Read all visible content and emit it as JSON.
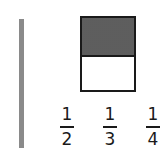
{
  "figure": {
    "vertical_bar": {
      "style": "stippled-gray"
    },
    "fraction_box": {
      "cells": 2,
      "shaded_cells": 1,
      "shaded_position": "top"
    },
    "options": [
      {
        "numerator": "1",
        "denominator": "2"
      },
      {
        "numerator": "1",
        "denominator": "3"
      },
      {
        "numerator": "1",
        "denominator": "4"
      }
    ]
  },
  "colors": {
    "ink": "#1a1a1a",
    "bar_gray": "#8a8a8a",
    "shade": "#cfcfcf"
  }
}
